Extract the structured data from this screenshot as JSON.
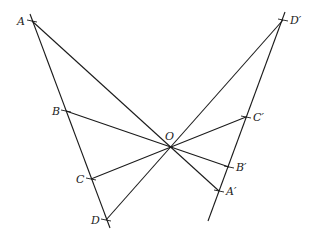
{
  "diagram": {
    "type": "geometry-homothety",
    "colors": {
      "stroke": "#1a1a1a",
      "text": "#222222",
      "background": "#ffffff"
    },
    "center": {
      "name": "O",
      "label": "O",
      "x": 170,
      "y": 147
    },
    "points": {
      "A": {
        "label": "A",
        "x": 32,
        "y": 21
      },
      "B": {
        "label": "B",
        "x": 66,
        "y": 111
      },
      "C": {
        "label": "C",
        "x": 91,
        "y": 179
      },
      "D": {
        "label": "D",
        "x": 106,
        "y": 220
      },
      "Ap": {
        "label": "A′",
        "x": 219,
        "y": 191
      },
      "Bp": {
        "label": "B′",
        "x": 229,
        "y": 167
      },
      "Cp": {
        "label": "C′",
        "x": 246,
        "y": 117
      },
      "Dp": {
        "label": "D′",
        "x": 283,
        "y": 20
      }
    },
    "lines": [
      {
        "name": "line-ABCD",
        "from": [
          30,
          14
        ],
        "to": [
          110,
          228
        ]
      },
      {
        "name": "line-DpCpBpAp",
        "from": [
          285,
          12
        ],
        "to": [
          208,
          221
        ]
      },
      {
        "name": "segment-A-Ap",
        "from": "A",
        "to": "Ap"
      },
      {
        "name": "segment-B-Bp",
        "from": "B",
        "to": "Bp"
      },
      {
        "name": "segment-C-Cp",
        "from": "C",
        "to": "Cp"
      },
      {
        "name": "segment-D-Dp",
        "from": "D",
        "to": "Dp"
      }
    ]
  }
}
